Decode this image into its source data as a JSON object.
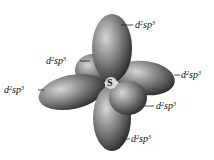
{
  "diagram": {
    "center_atom": "S",
    "orbital_labels": [
      {
        "id": "top",
        "base": "d",
        "sup1": "2",
        "mid": "sp",
        "sup2": "3"
      },
      {
        "id": "upper-left",
        "base": "d",
        "sup1": "2",
        "mid": "sp",
        "sup2": "3"
      },
      {
        "id": "left",
        "base": "d",
        "sup1": "2",
        "mid": "sp",
        "sup2": "3"
      },
      {
        "id": "right",
        "base": "d",
        "sup1": "2",
        "mid": "sp",
        "sup2": "3"
      },
      {
        "id": "lower-right",
        "base": "d",
        "sup1": "2",
        "mid": "sp",
        "sup2": "3"
      },
      {
        "id": "bottom",
        "base": "d",
        "sup1": "2",
        "mid": "sp",
        "sup2": "3"
      }
    ],
    "colors": {
      "lobe_dark": "#3a3a3a",
      "lobe_light": "#bdbdbd",
      "center": "#d8d8d8"
    }
  }
}
